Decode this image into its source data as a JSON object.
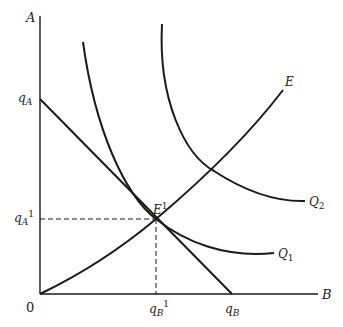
{
  "diagram": {
    "type": "isoquant-expansion-path",
    "axes": {
      "y_label": "A",
      "x_label": "B",
      "origin_label": "0"
    },
    "intercepts": {
      "y_intercept_label": "q",
      "y_intercept_sub": "A",
      "x_intercept_label": "q",
      "x_intercept_sub": "B"
    },
    "equilibrium": {
      "point_label": "E",
      "point_sup": "1",
      "y_label": "q",
      "y_sub": "A",
      "y_sup": "1",
      "x_label": "q",
      "x_sub": "B",
      "x_sup": "1"
    },
    "curves": [
      {
        "name": "Q",
        "sub": "1",
        "kind": "isoquant"
      },
      {
        "name": "Q",
        "sub": "2",
        "kind": "isoquant"
      },
      {
        "name": "E",
        "sub": "",
        "kind": "expansion-path"
      }
    ],
    "colors": {
      "line": "#1a1a1a",
      "background": "#ffffff"
    }
  }
}
